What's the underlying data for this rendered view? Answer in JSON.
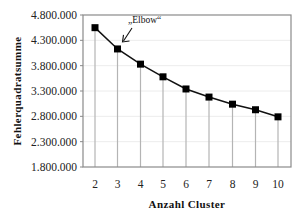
{
  "chart_data": {
    "type": "line",
    "title": "",
    "xlabel": "Anzahl Cluster",
    "ylabel": "Fehlerquadratsumme",
    "x": [
      2,
      3,
      4,
      5,
      6,
      7,
      8,
      9,
      10
    ],
    "series": [
      {
        "name": "Fehlerquadratsumme",
        "values": [
          4550000,
          4130000,
          3830000,
          3580000,
          3340000,
          3180000,
          3040000,
          2930000,
          2790000
        ]
      }
    ],
    "ylim": [
      1800000,
      4800000
    ],
    "yticks": [
      1800000,
      2300000,
      2800000,
      3300000,
      3800000,
      4300000,
      4800000
    ],
    "ytick_labels": [
      "1.800.000",
      "2.300.000",
      "2.800.000",
      "3.300.000",
      "3.800.000",
      "4.300.000",
      "4.800.000"
    ],
    "xtick_labels": [
      "2",
      "3",
      "4",
      "5",
      "6",
      "7",
      "8",
      "9",
      "10"
    ],
    "grid": "horizontal (faint) plus vertical drop lines from each point",
    "marker": "square",
    "legend": "none",
    "annotations": [
      {
        "text": "„Elbow“",
        "points_to_x": 3
      }
    ],
    "colors": {
      "line": "#111111",
      "marker": "#000000",
      "drop_line": "#b4b4b4",
      "grid": "#ececec",
      "frame": "#8a8a8a"
    }
  }
}
